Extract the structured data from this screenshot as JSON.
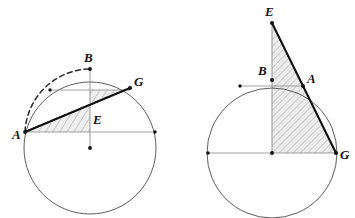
{
  "figure": {
    "background_color": "#ffffff",
    "line_color": "#1a1a1a",
    "thin_line_color": "#6e6e6e",
    "hatch_color": "#8a8a8a",
    "hatch_fill": "#ededed",
    "width": 355,
    "height": 218
  },
  "diagrams": [
    {
      "id": "left-diagram",
      "name": "left-circle-diagram",
      "circle": {
        "cx": 90,
        "cy": 148,
        "r": 66
      },
      "center_dot": {
        "x": 90,
        "y": 148
      },
      "points": [
        {
          "id": "A",
          "label": "A",
          "x": 25,
          "y": 132,
          "label_x": 14,
          "label_y": 138
        },
        {
          "id": "B",
          "label": "B",
          "x": 90,
          "y": 69,
          "label_x": 84,
          "label_y": 62
        },
        {
          "id": "G",
          "label": "G",
          "x": 130,
          "y": 88,
          "label_x": 134,
          "label_y": 85
        },
        {
          "id": "E",
          "label": "E",
          "x": 90,
          "y": 110,
          "label_x": 94,
          "label_y": 123
        }
      ],
      "extra_dots": [
        {
          "x": 50,
          "y": 90
        },
        {
          "x": 155,
          "y": 132
        }
      ],
      "horizontal_chords": [
        {
          "x1": 50,
          "y1": 90,
          "x2": 130,
          "y2": 90
        },
        {
          "x1": 25,
          "y1": 132,
          "x2": 155,
          "y2": 132
        }
      ],
      "vertical_line": {
        "x1": 90,
        "y1": 69,
        "x2": 90,
        "y2": 148
      },
      "solid_chord": {
        "x1": 25,
        "y1": 132,
        "x2": 130,
        "y2": 88
      },
      "dashed_chord": {
        "x1": 25,
        "y1": 132,
        "x2": 90,
        "y2": 69
      },
      "dashed_arc": {
        "from_x": 25,
        "from_y": 132,
        "to_x": 90,
        "to_y": 69
      },
      "hatched_region": "A-E-G-B quadrilateral wedge between chord AG and chord line"
    },
    {
      "id": "right-diagram",
      "name": "right-circle-diagram",
      "circle": {
        "cx": 272,
        "cy": 153,
        "r": 65
      },
      "center_dot": {
        "x": 272,
        "y": 153
      },
      "points": [
        {
          "id": "E",
          "label": "E",
          "x": 272,
          "y": 23,
          "label_x": 266,
          "label_y": 16
        },
        {
          "id": "B",
          "label": "B",
          "x": 272,
          "y": 80,
          "label_x": 259,
          "label_y": 73
        },
        {
          "id": "A",
          "label": "A",
          "x": 303,
          "y": 86,
          "label_x": 307,
          "label_y": 82
        },
        {
          "id": "G",
          "label": "G",
          "x": 336,
          "y": 153,
          "label_x": 340,
          "label_y": 158
        }
      ],
      "extra_dots": [
        {
          "x": 240,
          "y": 86
        },
        {
          "x": 208,
          "y": 153
        }
      ],
      "horizontal_chords": [
        {
          "x1": 240,
          "y1": 86,
          "x2": 303,
          "y2": 86
        },
        {
          "x1": 208,
          "y1": 153,
          "x2": 336,
          "y2": 153
        }
      ],
      "vertical_line": {
        "x1": 272,
        "y1": 23,
        "x2": 272,
        "y2": 153
      },
      "solid_lines": [
        {
          "from": "E",
          "to": "G",
          "x1": 272,
          "y1": 23,
          "x2": 336,
          "y2": 153
        }
      ],
      "hatched_region": "E-G-center triangle bounded by vertical EV, line EG and base VG"
    }
  ],
  "labels": {
    "left": {
      "A": "A",
      "B": "B",
      "G": "G",
      "E": "E"
    },
    "right": {
      "E": "E",
      "B": "B",
      "A": "A",
      "G": "G"
    }
  }
}
